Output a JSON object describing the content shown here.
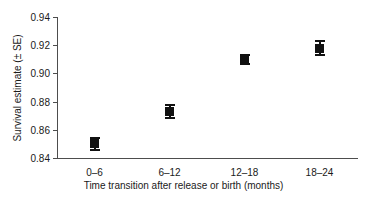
{
  "chart_data": {
    "type": "scatter",
    "title": "",
    "xlabel": "Time transition after release or birth (months)",
    "ylabel": "Survival estimate (± SE)",
    "categories": [
      "0–6",
      "6–12",
      "12–18",
      "18–24"
    ],
    "values": [
      0.85,
      0.873,
      0.91,
      0.918
    ],
    "errors": [
      0.005,
      0.005,
      0.004,
      0.006
    ],
    "ylim": [
      0.84,
      0.94
    ],
    "yticks": [
      0.84,
      0.86,
      0.88,
      0.9,
      0.92,
      0.94
    ],
    "ytick_labels": [
      "0.84",
      "0.86",
      "0.88",
      "0.90",
      "0.92",
      "0.94"
    ],
    "grid": false,
    "legend": false,
    "marker": "square",
    "marker_color": "#111111",
    "axis_color": "#4d4d4d",
    "text_color": "#1a1a1a",
    "background": "#ffffff"
  }
}
